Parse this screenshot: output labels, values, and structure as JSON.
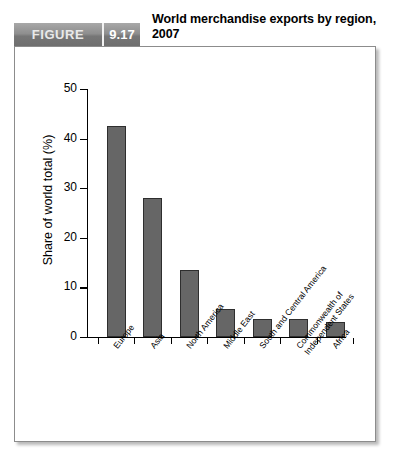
{
  "header": {
    "badge_word": "FIGURE",
    "badge_number": "9.17",
    "title": "World merchandise exports by region, 2007"
  },
  "colors": {
    "bar_fill": "#666666",
    "bar_stroke": "#2e2e2e",
    "badge_gray": "#8e8e8e",
    "frame_border": "#8c8c8c",
    "axis": "#000000"
  },
  "chart_data": {
    "type": "bar",
    "title": "World merchandise exports by region, 2007",
    "xlabel": "",
    "ylabel": "Share of world total (%)",
    "ylim": [
      0,
      50
    ],
    "yticks": [
      0,
      10,
      20,
      30,
      40,
      50
    ],
    "ytick_labels": [
      "0",
      "10",
      "20",
      "30",
      "40",
      "50"
    ],
    "grid": false,
    "legend": null,
    "categories": [
      "Europe",
      "Asia",
      "North America",
      "Middle East",
      "South and Central America",
      "Commonwealth of Independent States",
      "Africa"
    ],
    "values": [
      42.5,
      28.0,
      13.5,
      5.6,
      3.7,
      3.7,
      3.1
    ]
  }
}
